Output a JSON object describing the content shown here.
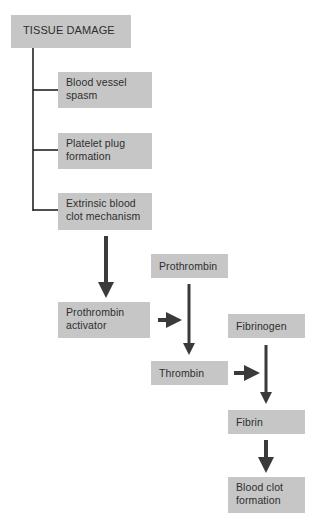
{
  "diagram": {
    "colors": {
      "box_fill": "#c6c6c6",
      "text": "#2e2e2e",
      "arrow": "#3a3a3a",
      "line": "#222222"
    },
    "nodes": {
      "tissue_damage": {
        "lines": [
          "TISSUE DAMAGE"
        ]
      },
      "vessel_spasm": {
        "lines": [
          "Blood vessel",
          "spasm"
        ]
      },
      "platelet_plug": {
        "lines": [
          "Platelet plug",
          "formation"
        ]
      },
      "extrinsic": {
        "lines": [
          "Extrinsic blood",
          "clot mechanism"
        ]
      },
      "prothrombin_activator": {
        "lines": [
          "Prothrombin",
          "activator"
        ]
      },
      "prothrombin": {
        "lines": [
          "Prothrombin"
        ]
      },
      "thrombin": {
        "lines": [
          "Thrombin"
        ]
      },
      "fibrinogen": {
        "lines": [
          "Fibrinogen"
        ]
      },
      "fibrin": {
        "lines": [
          "Fibrin"
        ]
      },
      "blood_clot": {
        "lines": [
          "Blood clot",
          "formation"
        ]
      }
    },
    "edges": [
      {
        "from": "tissue_damage",
        "to": "vessel_spasm",
        "type": "branch"
      },
      {
        "from": "tissue_damage",
        "to": "platelet_plug",
        "type": "branch"
      },
      {
        "from": "tissue_damage",
        "to": "extrinsic",
        "type": "branch"
      },
      {
        "from": "extrinsic",
        "to": "prothrombin_activator",
        "type": "arrow"
      },
      {
        "from": "prothrombin_activator",
        "to": "prothrombin_to_thrombin",
        "type": "arrow"
      },
      {
        "from": "prothrombin",
        "to": "thrombin",
        "type": "arrow"
      },
      {
        "from": "thrombin",
        "to": "fibrinogen_to_fibrin",
        "type": "arrow"
      },
      {
        "from": "fibrinogen",
        "to": "fibrin",
        "type": "arrow"
      },
      {
        "from": "fibrin",
        "to": "blood_clot",
        "type": "arrow"
      }
    ]
  }
}
